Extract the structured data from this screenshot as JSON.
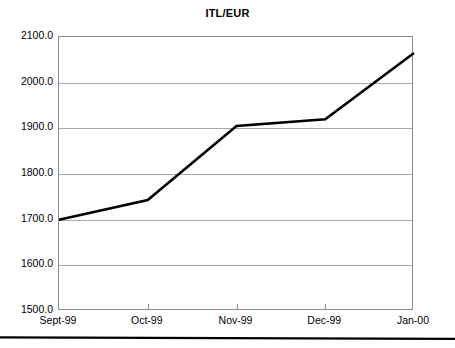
{
  "chart_data": {
    "type": "line",
    "title": "ITL/EUR",
    "xlabel": "",
    "ylabel": "",
    "categories": [
      "Sept-99",
      "Oct-99",
      "Nov-99",
      "Dec-99",
      "Jan-00"
    ],
    "values": [
      1700.0,
      1743.0,
      1905.0,
      1920.0,
      2065.0
    ],
    "series": [
      {
        "name": "ITL/EUR",
        "values": [
          1700.0,
          1743.0,
          1905.0,
          1920.0,
          2065.0
        ],
        "color": "#000000"
      }
    ],
    "ylim": [
      1500.0,
      2100.0
    ],
    "ytick_values": [
      1500.0,
      1600.0,
      1700.0,
      1800.0,
      1900.0,
      2000.0,
      2100.0
    ],
    "ytick_labels": [
      "1500.0",
      "1600.0",
      "1700.0",
      "1800.0",
      "1900.0",
      "2000.0",
      "2100.0"
    ],
    "grid": true,
    "legend": "none",
    "gridline_color": "#a8a8a8",
    "axis_color": "#8c8c8c",
    "line_color": "#000000"
  },
  "decorations": {
    "bottom_rule_color": "#000000"
  }
}
